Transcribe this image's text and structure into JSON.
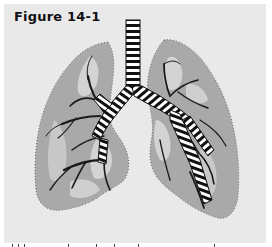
{
  "figure": {
    "title": "Figure 14-1",
    "colors": {
      "background": "#e9e9e9",
      "lung_fill": "#a9a9a9",
      "lung_light_patch": "#d3d3d3",
      "airway_dark": "#111111",
      "airway_light": "#ffffff",
      "page": "#ffffff"
    }
  },
  "caption": {
    "visible": "partially cut off at bottom edge"
  }
}
